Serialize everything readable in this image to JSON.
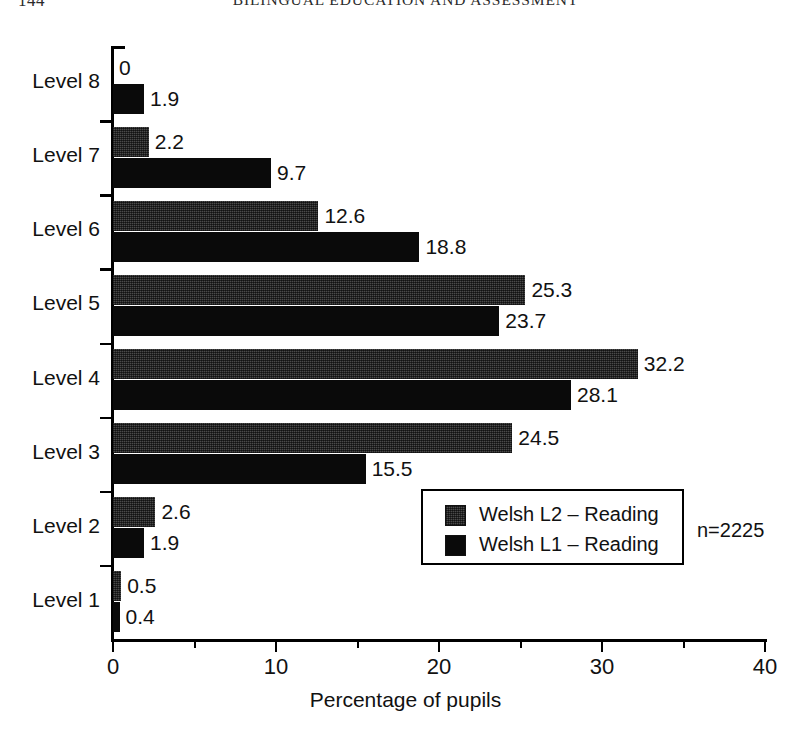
{
  "page": {
    "folio": "144",
    "running_head": "BILINGUAL EDUCATION AND ASSESSMENT"
  },
  "annotation": {
    "sample_size": "n=2225"
  },
  "legend": {
    "entries": [
      {
        "label": "Welsh L2 – Reading",
        "color": "#4a4a4a"
      },
      {
        "label": "Welsh L1 – Reading",
        "color": "#0a0a0a"
      }
    ]
  },
  "chart_data": {
    "type": "bar",
    "orientation": "horizontal",
    "title": "",
    "subtitle": "",
    "xlabel": "Percentage of pupils",
    "ylabel": "",
    "xlim": [
      0,
      40
    ],
    "xticks": [
      0,
      10,
      20,
      30,
      40
    ],
    "xticklabels": [
      "0",
      "10",
      "20",
      "30",
      "40"
    ],
    "xminorticks": [
      5,
      15,
      25,
      35
    ],
    "grid": false,
    "legend_position": "inside-lower-right",
    "categories": [
      "Level 8",
      "Level 7",
      "Level 6",
      "Level 5",
      "Level 4",
      "Level 3",
      "Level 2",
      "Level 1"
    ],
    "series": [
      {
        "name": "Welsh L2 – Reading",
        "color": "#4a4a4a",
        "values": [
          0,
          2.2,
          12.6,
          25.3,
          32.2,
          24.5,
          2.6,
          0.5
        ],
        "labels": [
          "0",
          "2.2",
          "12.6",
          "25.3",
          "32.2",
          "24.5",
          "2.6",
          "0.5"
        ]
      },
      {
        "name": "Welsh L1 – Reading",
        "color": "#0a0a0a",
        "values": [
          1.9,
          9.7,
          18.8,
          23.7,
          28.1,
          15.5,
          1.9,
          0.4
        ],
        "labels": [
          "1.9",
          "9.7",
          "18.8",
          "23.7",
          "28.1",
          "15.5",
          "1.9",
          "0.4"
        ]
      }
    ]
  }
}
